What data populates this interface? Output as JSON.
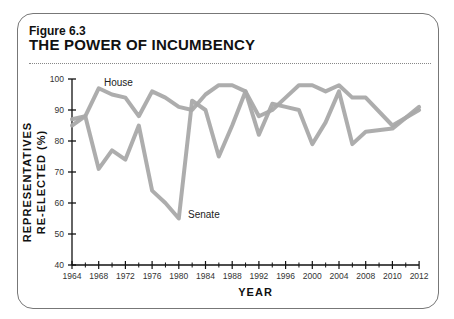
{
  "figure": {
    "label": "Figure 6.3",
    "title": "THE POWER OF INCUMBENCY"
  },
  "chart_data": {
    "type": "line",
    "title": "THE POWER OF INCUMBENCY",
    "xlabel": "YEAR",
    "ylabel": "REPRESENTATIVES RE-ELECTED (%)",
    "ylabel_lines": [
      "REPRESENTATIVES",
      "RE-ELECTED (%)"
    ],
    "ylim": [
      40,
      100
    ],
    "yticks": [
      40,
      50,
      60,
      70,
      80,
      90,
      100
    ],
    "xtick_labels": [
      "1964",
      "1968",
      "1972",
      "1976",
      "1980",
      "1984",
      "1988",
      "1992",
      "1996",
      "2000",
      "2004",
      "2008",
      "2010",
      "2012"
    ],
    "grid": false,
    "legend": "inline labels",
    "x": [
      1964,
      1966,
      1968,
      1970,
      1972,
      1974,
      1976,
      1978,
      1980,
      1982,
      1984,
      1986,
      1988,
      1990,
      1992,
      1994,
      1996,
      1998,
      2000,
      2002,
      2004,
      2006,
      2008,
      2010,
      2012
    ],
    "series": [
      {
        "name": "House",
        "color": "#a9a9a9",
        "values": [
          87,
          88,
          97,
          95,
          94,
          88,
          96,
          94,
          91,
          90,
          95,
          98,
          98,
          96,
          88,
          90,
          94,
          98,
          98,
          96,
          98,
          94,
          94,
          85,
          90
        ]
      },
      {
        "name": "Senate",
        "color": "#a9a9a9",
        "values": [
          85,
          88,
          71,
          77,
          74,
          85,
          64,
          60,
          55,
          93,
          90,
          75,
          85,
          96,
          82,
          92,
          91,
          90,
          79,
          86,
          96,
          79,
          83,
          84,
          91
        ]
      }
    ]
  }
}
